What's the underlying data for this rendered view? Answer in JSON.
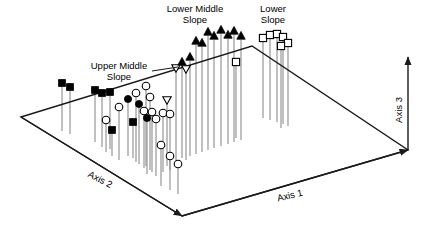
{
  "figure": {
    "title": "",
    "background_color": "#ffffff",
    "line_color": "#1a1a1a",
    "stem_color": "#8c8c8c",
    "symbol_fill_dark": "#000000",
    "symbol_fill_light": "#ffffff",
    "width": 426,
    "height": 232
  },
  "axes": [
    {
      "name": "axis-1",
      "label": "Axis 1",
      "x": 290,
      "y": 196,
      "rotation": -13.5
    },
    {
      "name": "axis-2",
      "label": "Axis 2",
      "x": 100,
      "y": 180,
      "rotation": 27.5
    },
    {
      "name": "axis-3",
      "label": "Axis 3",
      "x": 399,
      "y": 110,
      "rotation": -90
    }
  ],
  "annotations": [
    {
      "name": "lower-middle-slope",
      "lines": [
        "Lower Middle",
        "Slope"
      ],
      "x": 195,
      "y": 9,
      "leader": null
    },
    {
      "name": "upper-middle-slope",
      "lines": [
        "Upper Middle",
        "Slope"
      ],
      "x": 119,
      "y": 66,
      "leader": {
        "x1": 152,
        "y1": 71,
        "x2": 178,
        "y2": 67
      }
    },
    {
      "name": "lower-slope",
      "lines": [
        "Lower",
        "Slope"
      ],
      "x": 273,
      "y": 9,
      "leader": null
    }
  ],
  "base_plane": {
    "name": "base-quadrilateral",
    "points": [
      {
        "x": 21,
        "y": 117
      },
      {
        "x": 252,
        "y": 46
      },
      {
        "x": 408,
        "y": 150
      },
      {
        "x": 182,
        "y": 216
      }
    ]
  },
  "axis_arrows": {
    "axis1": {
      "x1": 182,
      "y1": 216,
      "x2": 408,
      "y2": 150
    },
    "axis2": {
      "x1": 21,
      "y1": 117,
      "x2": 182,
      "y2": 216
    },
    "axis3": {
      "x1": 408,
      "y1": 150,
      "x2": 408,
      "y2": 57
    }
  },
  "chart_data": {
    "type": "scatter",
    "title": "",
    "xlabel": "Axis 1",
    "ylabel": "Axis 2",
    "zlabel": "Axis 3",
    "grid": false,
    "legend": "none",
    "projection": "3d-stem-plot",
    "groups": [
      {
        "name": "Upper Slope",
        "symbol": "filled-square",
        "count": 6
      },
      {
        "name": "Upper Middle Slope",
        "symbol": "open-circle",
        "count": 22
      },
      {
        "name": "Upper Middle Slope (dark)",
        "symbol": "filled-circle",
        "count": 6
      },
      {
        "name": "Lower Middle Slope",
        "symbol": "filled-triangle-up",
        "count": 18
      },
      {
        "name": "Lower Middle Slope (inverted)",
        "symbol": "open-triangle-down",
        "count": 5
      },
      {
        "name": "Lower Slope",
        "symbol": "open-square",
        "count": 9
      }
    ],
    "points": [
      {
        "group": "Upper Slope",
        "symbol": "filled-square",
        "sx": 62,
        "sy": 83,
        "base_y": 131
      },
      {
        "group": "Upper Slope",
        "symbol": "filled-square",
        "sx": 70,
        "sy": 87,
        "base_y": 134
      },
      {
        "group": "Upper Slope",
        "symbol": "filled-square",
        "sx": 95,
        "sy": 90,
        "base_y": 142
      },
      {
        "group": "Upper Slope",
        "symbol": "filled-square",
        "sx": 102,
        "sy": 93,
        "base_y": 147
      },
      {
        "group": "Upper Slope",
        "symbol": "filled-square",
        "sx": 110,
        "sy": 92,
        "base_y": 149
      },
      {
        "group": "Upper Slope",
        "symbol": "filled-square",
        "sx": 133,
        "sy": 122,
        "base_y": 158
      },
      {
        "group": "Upper Middle Slope (dark)",
        "symbol": "filled-circle",
        "sx": 128,
        "sy": 99,
        "base_y": 156
      },
      {
        "group": "Upper Middle Slope",
        "symbol": "open-circle",
        "sx": 119,
        "sy": 107,
        "base_y": 160
      },
      {
        "group": "Upper Middle Slope",
        "symbol": "open-circle",
        "sx": 136,
        "sy": 93,
        "base_y": 162
      },
      {
        "group": "Upper Middle Slope (dark)",
        "symbol": "filled-circle",
        "sx": 139,
        "sy": 104,
        "base_y": 164
      },
      {
        "group": "Upper Middle Slope",
        "symbol": "open-circle",
        "sx": 146,
        "sy": 86,
        "base_y": 166
      },
      {
        "group": "Upper Middle Slope",
        "symbol": "open-circle",
        "sx": 144,
        "sy": 111,
        "base_y": 168
      },
      {
        "group": "Upper Middle Slope",
        "symbol": "open-circle",
        "sx": 150,
        "sy": 97,
        "base_y": 170
      },
      {
        "group": "Upper Middle Slope",
        "symbol": "open-circle",
        "sx": 152,
        "sy": 112,
        "base_y": 172
      },
      {
        "group": "Upper Middle Slope (dark)",
        "symbol": "filled-circle",
        "sx": 147,
        "sy": 118,
        "base_y": 174
      },
      {
        "group": "Upper Middle Slope",
        "symbol": "open-circle",
        "sx": 156,
        "sy": 119,
        "base_y": 176
      },
      {
        "group": "Upper Middle Slope",
        "symbol": "open-circle",
        "sx": 163,
        "sy": 113,
        "base_y": 172
      },
      {
        "group": "Upper Middle Slope",
        "symbol": "open-circle",
        "sx": 170,
        "sy": 114,
        "base_y": 170
      },
      {
        "group": "Upper Middle Slope",
        "symbol": "open-circle",
        "sx": 161,
        "sy": 145,
        "base_y": 186
      },
      {
        "group": "Upper Middle Slope",
        "symbol": "open-circle",
        "sx": 170,
        "sy": 156,
        "base_y": 190
      },
      {
        "group": "Upper Middle Slope",
        "symbol": "open-circle",
        "sx": 178,
        "sy": 164,
        "base_y": 194
      },
      {
        "group": "Upper Middle Slope",
        "symbol": "open-circle",
        "sx": 106,
        "sy": 120,
        "base_y": 152
      },
      {
        "group": "Upper Middle Slope (dark)",
        "symbol": "filled-square",
        "sx": 112,
        "sy": 130,
        "base_y": 156
      },
      {
        "group": "Lower Middle Slope (inverted)",
        "symbol": "open-triangle-down",
        "sx": 167,
        "sy": 100,
        "base_y": 166
      },
      {
        "group": "Lower Middle Slope (inverted)",
        "symbol": "open-triangle-down",
        "sx": 176,
        "sy": 68,
        "base_y": 164
      },
      {
        "group": "Lower Middle Slope (inverted)",
        "symbol": "open-triangle-down",
        "sx": 186,
        "sy": 69,
        "base_y": 160
      },
      {
        "group": "Lower Middle Slope",
        "symbol": "filled-triangle-up",
        "sx": 182,
        "sy": 62,
        "base_y": 158
      },
      {
        "group": "Lower Middle Slope",
        "symbol": "filled-triangle-up",
        "sx": 190,
        "sy": 57,
        "base_y": 156
      },
      {
        "group": "Lower Middle Slope",
        "symbol": "filled-triangle-up",
        "sx": 196,
        "sy": 41,
        "base_y": 154
      },
      {
        "group": "Lower Middle Slope",
        "symbol": "filled-triangle-up",
        "sx": 202,
        "sy": 43,
        "base_y": 152
      },
      {
        "group": "Lower Middle Slope",
        "symbol": "filled-triangle-up",
        "sx": 208,
        "sy": 32,
        "base_y": 150
      },
      {
        "group": "Lower Middle Slope",
        "symbol": "filled-triangle-up",
        "sx": 214,
        "sy": 36,
        "base_y": 148
      },
      {
        "group": "Lower Middle Slope",
        "symbol": "filled-triangle-up",
        "sx": 221,
        "sy": 30,
        "base_y": 146
      },
      {
        "group": "Lower Middle Slope",
        "symbol": "filled-triangle-up",
        "sx": 228,
        "sy": 35,
        "base_y": 144
      },
      {
        "group": "Lower Middle Slope",
        "symbol": "filled-triangle-up",
        "sx": 234,
        "sy": 31,
        "base_y": 142
      },
      {
        "group": "Lower Middle Slope",
        "symbol": "filled-triangle-up",
        "sx": 241,
        "sy": 36,
        "base_y": 140
      },
      {
        "group": "Lower Middle Slope",
        "symbol": "open-square",
        "sx": 236,
        "sy": 62,
        "base_y": 138
      },
      {
        "group": "Lower Slope",
        "symbol": "open-square",
        "sx": 263,
        "sy": 38,
        "base_y": 118
      },
      {
        "group": "Lower Slope",
        "symbol": "open-square",
        "sx": 270,
        "sy": 35,
        "base_y": 120
      },
      {
        "group": "Lower Slope",
        "symbol": "open-square",
        "sx": 277,
        "sy": 34,
        "base_y": 122
      },
      {
        "group": "Lower Slope",
        "symbol": "open-square",
        "sx": 283,
        "sy": 37,
        "base_y": 124
      },
      {
        "group": "Lower Slope",
        "symbol": "open-square",
        "sx": 288,
        "sy": 43,
        "base_y": 126
      },
      {
        "group": "Lower Slope",
        "symbol": "open-square",
        "sx": 281,
        "sy": 46,
        "base_y": 128
      }
    ]
  }
}
